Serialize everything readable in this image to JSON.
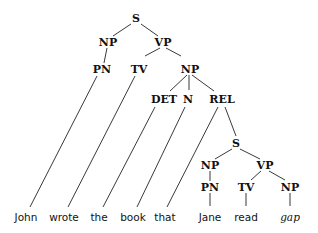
{
  "diagram": {
    "type": "syntax-tree",
    "nodes": [
      {
        "id": "s1",
        "label": "S",
        "x": 136,
        "y": 18,
        "kind": "cat"
      },
      {
        "id": "np1",
        "label": "NP",
        "x": 108,
        "y": 42,
        "kind": "cat"
      },
      {
        "id": "vp1",
        "label": "VP",
        "x": 163,
        "y": 42,
        "kind": "cat"
      },
      {
        "id": "pn1",
        "label": "PN",
        "x": 102,
        "y": 69,
        "kind": "cat"
      },
      {
        "id": "tv1",
        "label": "TV",
        "x": 139,
        "y": 69,
        "kind": "cat"
      },
      {
        "id": "np2",
        "label": "NP",
        "x": 190,
        "y": 69,
        "kind": "cat"
      },
      {
        "id": "det",
        "label": "DET",
        "x": 164,
        "y": 99,
        "kind": "cat"
      },
      {
        "id": "n",
        "label": "N",
        "x": 188,
        "y": 99,
        "kind": "cat"
      },
      {
        "id": "rel",
        "label": "REL",
        "x": 222,
        "y": 99,
        "kind": "cat"
      },
      {
        "id": "s2",
        "label": "S",
        "x": 236,
        "y": 143,
        "kind": "cat"
      },
      {
        "id": "np3",
        "label": "NP",
        "x": 210,
        "y": 165,
        "kind": "cat"
      },
      {
        "id": "vp2",
        "label": "VP",
        "x": 265,
        "y": 165,
        "kind": "cat"
      },
      {
        "id": "pn2",
        "label": "PN",
        "x": 210,
        "y": 187,
        "kind": "cat"
      },
      {
        "id": "tv2",
        "label": "TV",
        "x": 246,
        "y": 187,
        "kind": "cat"
      },
      {
        "id": "np4",
        "label": "NP",
        "x": 290,
        "y": 187,
        "kind": "cat"
      },
      {
        "id": "w1",
        "label": "John",
        "x": 26,
        "y": 217,
        "kind": "word"
      },
      {
        "id": "w2",
        "label": "wrote",
        "x": 64,
        "y": 217,
        "kind": "word"
      },
      {
        "id": "w3",
        "label": "the",
        "x": 99,
        "y": 217,
        "kind": "word"
      },
      {
        "id": "w4",
        "label": "book",
        "x": 133,
        "y": 217,
        "kind": "word"
      },
      {
        "id": "w5",
        "label": "that",
        "x": 165,
        "y": 217,
        "kind": "word"
      },
      {
        "id": "w6",
        "label": "Jane",
        "x": 210,
        "y": 217,
        "kind": "word"
      },
      {
        "id": "w7",
        "label": "read",
        "x": 246,
        "y": 217,
        "kind": "word"
      },
      {
        "id": "w8",
        "label": "gap",
        "x": 290,
        "y": 217,
        "kind": "gap"
      }
    ],
    "edges": [
      {
        "from": "s1",
        "to": "np1",
        "x1": 131,
        "y1": 24,
        "x2": 113,
        "y2": 36
      },
      {
        "from": "s1",
        "to": "vp1",
        "x1": 141,
        "y1": 24,
        "x2": 158,
        "y2": 36
      },
      {
        "from": "np1",
        "to": "pn1",
        "x1": 107,
        "y1": 48,
        "x2": 104,
        "y2": 63
      },
      {
        "from": "vp1",
        "to": "tv1",
        "x1": 160,
        "y1": 48,
        "x2": 145,
        "y2": 56
      },
      {
        "from": "vp1",
        "to": "np2",
        "x1": 166,
        "y1": 48,
        "x2": 181,
        "y2": 56
      },
      {
        "from": "np2",
        "to": "det",
        "x1": 187,
        "y1": 75,
        "x2": 170,
        "y2": 91
      },
      {
        "from": "np2",
        "to": "n",
        "x1": 189,
        "y1": 75,
        "x2": 189,
        "y2": 90
      },
      {
        "from": "np2",
        "to": "rel",
        "x1": 192,
        "y1": 75,
        "x2": 214,
        "y2": 91
      },
      {
        "from": "pn1",
        "to": "w1",
        "x1": 97,
        "y1": 76,
        "x2": 30,
        "y2": 207
      },
      {
        "from": "tv1",
        "to": "w2",
        "x1": 135,
        "y1": 76,
        "x2": 68,
        "y2": 207
      },
      {
        "from": "det",
        "to": "w3",
        "x1": 155,
        "y1": 107,
        "x2": 103,
        "y2": 207
      },
      {
        "from": "n",
        "to": "w4",
        "x1": 185,
        "y1": 107,
        "x2": 137,
        "y2": 207
      },
      {
        "from": "rel",
        "to": "w5",
        "x1": 218,
        "y1": 107,
        "x2": 167,
        "y2": 207
      },
      {
        "from": "rel",
        "to": "s2",
        "x1": 225,
        "y1": 107,
        "x2": 236,
        "y2": 136
      },
      {
        "from": "s2",
        "to": "np3",
        "x1": 232,
        "y1": 149,
        "x2": 215,
        "y2": 159
      },
      {
        "from": "s2",
        "to": "vp2",
        "x1": 240,
        "y1": 149,
        "x2": 260,
        "y2": 159
      },
      {
        "from": "np3",
        "to": "pn2",
        "x1": 210,
        "y1": 171,
        "x2": 210,
        "y2": 181
      },
      {
        "from": "vp2",
        "to": "tv2",
        "x1": 261,
        "y1": 171,
        "x2": 251,
        "y2": 180
      },
      {
        "from": "vp2",
        "to": "np4",
        "x1": 269,
        "y1": 171,
        "x2": 285,
        "y2": 180
      },
      {
        "from": "pn2",
        "to": "w6",
        "x1": 210,
        "y1": 193,
        "x2": 210,
        "y2": 206
      },
      {
        "from": "tv2",
        "to": "w7",
        "x1": 246,
        "y1": 193,
        "x2": 246,
        "y2": 206
      },
      {
        "from": "np4",
        "to": "w8",
        "x1": 290,
        "y1": 193,
        "x2": 290,
        "y2": 206
      }
    ]
  }
}
